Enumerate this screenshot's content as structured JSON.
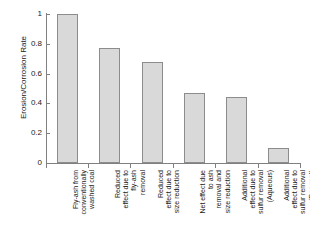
{
  "chart_data": {
    "type": "bar",
    "title": "",
    "xlabel": "",
    "ylabel": "Erosion/Corrosion Rate",
    "ylim": [
      0,
      1
    ],
    "yticks": [
      "0",
      "0.2",
      "0.4",
      "0.6",
      "0.8",
      "1"
    ],
    "ytick_values": [
      0,
      0.2,
      0.4,
      0.6,
      0.8,
      1
    ],
    "grid": false,
    "legend": false,
    "categories": [
      "Fly-ash from conventionally washed coal",
      "Reduced effect due to fly-ash removal",
      "Reduced effect due to size reduction",
      "Net effect due to ash removal and size reduction",
      "Additional effect due to sulfur removal (Aqueous)",
      "Additional effect due to sulfur removal (Reagent)"
    ],
    "category_lines": [
      [
        "Fly-ash from",
        "conventionally",
        "washed coal"
      ],
      [
        "Reduced",
        "effect due to",
        "fly-ash",
        "removal"
      ],
      [
        "Reduced",
        "effect due to",
        "size reduction"
      ],
      [
        "Net effect due",
        "to ash",
        "removal and",
        "size reduction"
      ],
      [
        "Additional",
        "effect due to",
        "sulfur removal",
        "(Aqueous)"
      ],
      [
        "Additional",
        "effect due to",
        "sulfur removal",
        "(Reagent)"
      ]
    ],
    "values": [
      1.0,
      0.77,
      0.68,
      0.47,
      0.44,
      0.1
    ],
    "bar_color": "#d9d9d9",
    "bar_border_color": "#8c8c8c",
    "axis_color": "#808080"
  }
}
